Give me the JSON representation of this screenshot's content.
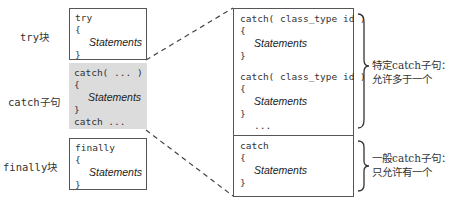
{
  "left_labels": {
    "try": "try块",
    "catch": "catch子句",
    "finally": "finally块"
  },
  "try_box": {
    "keyword": "try",
    "open_brace": "{",
    "statements": "Statements",
    "close_brace": "}"
  },
  "catch_box": {
    "header": "catch( ... )",
    "open_brace": "{",
    "statements": "Statements",
    "close_brace": "}",
    "more": "catch ..."
  },
  "finally_box": {
    "keyword": "finally",
    "open_brace": "{",
    "statements": "Statements",
    "close_brace": "}"
  },
  "detail_box": {
    "specific": [
      {
        "header": "catch( class_type id )",
        "open_brace": "{",
        "statements": "Statements",
        "close_brace": "}"
      },
      {
        "header": "catch( class_type id )",
        "open_brace": "{",
        "statements": "Statements",
        "close_brace": "}"
      }
    ],
    "ellipsis": "...",
    "general": {
      "header": "catch",
      "open_brace": "{",
      "statements": "Statements",
      "close_brace": "}"
    }
  },
  "annotations": {
    "specific_line1": "特定catch子句：",
    "specific_line2": "允许多于一个",
    "general_line1": "一般catch子句：",
    "general_line2": "只允许有一个"
  },
  "colors": {
    "border": "#555555",
    "highlight": "#dcdcdc",
    "dash": "#444444"
  }
}
